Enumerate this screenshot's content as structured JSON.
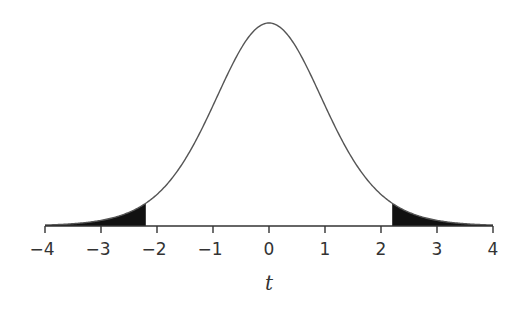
{
  "chart_data": {
    "type": "area",
    "title": "",
    "xlabel": "t",
    "ylabel": "",
    "distribution": "Student's t density",
    "xlim": [
      -4,
      4
    ],
    "x_ticks": [
      -4,
      -3,
      -2,
      -1,
      0,
      1,
      2,
      3,
      4
    ],
    "x_tick_labels": [
      "−4",
      "−3",
      "−2",
      "−1",
      "0",
      "1",
      "2",
      "3",
      "4"
    ],
    "shaded_regions": [
      {
        "name": "left tail",
        "from": -4,
        "to": -2.2
      },
      {
        "name": "right tail",
        "from": 2.2,
        "to": 4
      }
    ],
    "critical_value": 2.2,
    "curve_peak_x": 0,
    "grid": false,
    "legend": null
  },
  "colors": {
    "curve": "#555555",
    "shade": "#111111",
    "axis": "#333333"
  }
}
